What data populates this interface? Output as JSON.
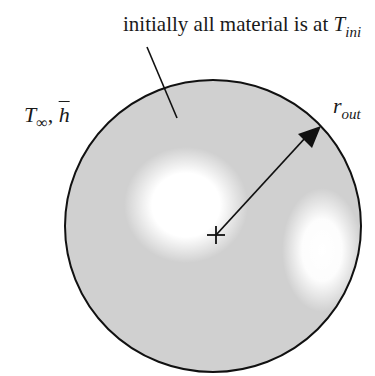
{
  "diagram": {
    "type": "sphere-cross-section",
    "labels": {
      "initial_condition": {
        "text": "initially all material is at ",
        "symbol": "T",
        "subscript": "ini"
      },
      "boundary_condition": {
        "symbol": "T",
        "subscript": "∞",
        "separator": ", ",
        "coefficient": "h"
      },
      "radius": {
        "symbol": "r",
        "subscript": "out"
      }
    },
    "center_marker": "+",
    "colors": {
      "fill": "#d0d0d0",
      "highlight": "#ffffff",
      "outline": "#111111",
      "text": "#1a1a1a"
    }
  }
}
